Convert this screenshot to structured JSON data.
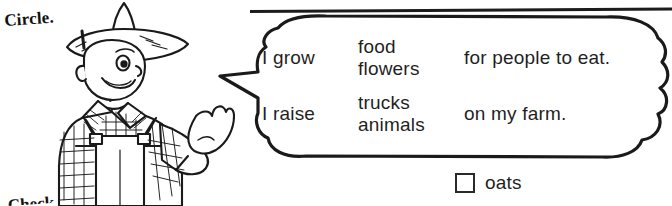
{
  "worksheet": {
    "directive": "Circle.",
    "partial_bottom_text": "Check."
  },
  "speech_bubble": {
    "rows": [
      {
        "lead": "I grow",
        "options": [
          "food",
          "flowers"
        ],
        "tail": "for people to eat."
      },
      {
        "lead": "I raise",
        "options": [
          "trucks",
          "animals"
        ],
        "tail": "on my farm."
      }
    ]
  },
  "checkbox_item": {
    "label": "oats",
    "checked": false
  },
  "icons": {
    "farmer": "farmer-illustration",
    "hat": "straw-hat-icon",
    "rule": "horizontal-rule"
  },
  "colors": {
    "ink": "#1a1a1a",
    "paper": "#ffffff"
  }
}
